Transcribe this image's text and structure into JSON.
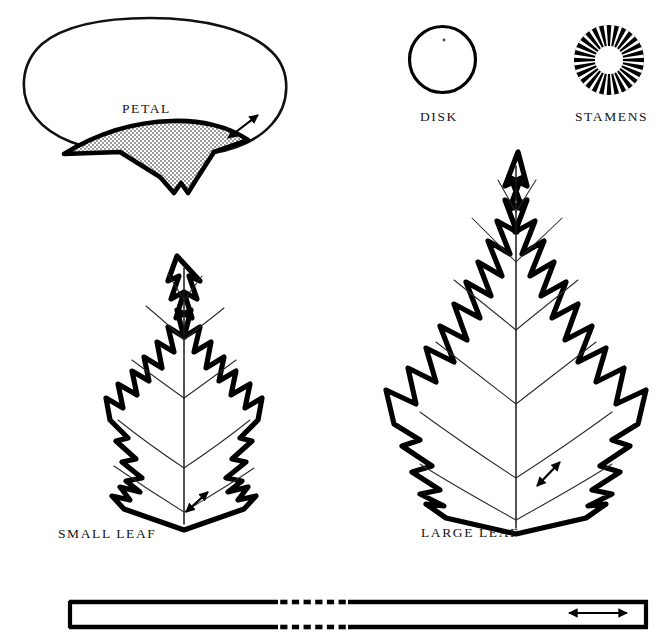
{
  "plate": {
    "width": 666,
    "height": 638,
    "background_color": "#ffffff",
    "ink_color": "#000000",
    "shading_color": "#b8b8b8",
    "description": "Line-drawing plate of flower and leaf parts"
  },
  "figures": {
    "petal": {
      "label": "PETAL",
      "label_x": 122,
      "label_y": 113,
      "shaded_region_present": true,
      "notch_present": true,
      "arrow": {
        "name": "petal-thickness-arrow",
        "x1": 228,
        "y1": 138,
        "x2": 258,
        "y2": 115
      }
    },
    "disk": {
      "label": "DISK",
      "label_x": 420,
      "label_y": 121,
      "center_x": 442.5,
      "center_y": 59.5,
      "radius": 33,
      "center_dot": true
    },
    "stamens": {
      "label": "STAMENS",
      "label_x": 575,
      "label_y": 121,
      "center_x": 609,
      "center_y": 60,
      "outer_radius": 35,
      "inner_radius": 14,
      "spoke_count": 28
    },
    "small_leaf": {
      "label": "SMALL LEAF",
      "label_x": 58,
      "label_y": 538,
      "arrow": {
        "name": "small-leaf-thickness-arrow",
        "x1": 186,
        "y1": 512,
        "x2": 208,
        "y2": 492
      }
    },
    "large_leaf": {
      "label": "LARGE LEAF",
      "label_x": 421,
      "label_y": 537,
      "arrow": {
        "name": "large-leaf-thickness-arrow",
        "x1": 537,
        "y1": 486,
        "x2": 560,
        "y2": 462
      }
    },
    "scale_bar": {
      "name": "scale-bar",
      "x_left": 69,
      "x_right": 648,
      "y_top": 602,
      "y_bottom": 627,
      "break_start": 278,
      "break_end": 348,
      "dash_count": 6,
      "arrow": {
        "name": "scale-bar-width-arrow",
        "x1": 569,
        "y1": 613,
        "x2": 627,
        "y2": 613
      }
    }
  }
}
